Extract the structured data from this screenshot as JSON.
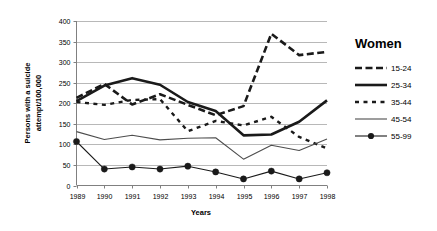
{
  "chart_data": {
    "type": "line",
    "title": "",
    "xlabel": "Years",
    "ylabel": "Persons with a suicide attempt/100,000",
    "ylabel_line1": "Persons with a suicide",
    "ylabel_line2": "attempt/100,000",
    "legend_title": "Women",
    "legend_position": "right",
    "grid": true,
    "x": [
      1989,
      1990,
      1991,
      1992,
      1993,
      1994,
      1995,
      1996,
      1997,
      1998
    ],
    "categories": [
      "1989",
      "1990",
      "1991",
      "1992",
      "1993",
      "1994",
      "1995",
      "1996",
      "1997",
      "1998"
    ],
    "xlim": [
      1989,
      1998
    ],
    "ylim": [
      0,
      400
    ],
    "yticks": [
      0,
      50,
      100,
      150,
      200,
      250,
      300,
      350,
      400
    ],
    "ytick_labels": [
      "0",
      "50",
      "100",
      "150",
      "200",
      "250",
      "300",
      "350",
      "400"
    ],
    "series": [
      {
        "name": "15-24",
        "style": "dashed-thick",
        "color": "#1a1a1a",
        "width": 2.6,
        "dash": "7,3.5",
        "marker": "none",
        "values": [
          213,
          247,
          197,
          222,
          196,
          171,
          193,
          369,
          317,
          325
        ]
      },
      {
        "name": "25-34",
        "style": "solid-thick",
        "color": "#1a1a1a",
        "width": 2.6,
        "dash": "none",
        "marker": "none",
        "values": [
          205,
          243,
          261,
          245,
          203,
          181,
          122,
          124,
          155,
          207
        ]
      },
      {
        "name": "35-44",
        "style": "dotted",
        "color": "#1a1a1a",
        "width": 2.4,
        "dash": "4,4.5",
        "marker": "none",
        "values": [
          203,
          196,
          208,
          210,
          132,
          157,
          146,
          167,
          118,
          90
        ]
      },
      {
        "name": "45-54",
        "style": "thin-solid",
        "color": "#4d4d4d",
        "width": 1.1,
        "dash": "none",
        "marker": "none",
        "values": [
          131,
          112,
          122,
          111,
          115,
          116,
          64,
          98,
          85,
          113
        ]
      },
      {
        "name": "55-99",
        "style": "solid-marker",
        "color": "#1a1a1a",
        "width": 1.1,
        "dash": "none",
        "marker": "circle",
        "values": [
          107,
          40,
          45,
          40,
          47,
          33,
          16,
          35,
          16,
          31
        ]
      }
    ]
  },
  "axis": {
    "x_title": "Years",
    "y_title_line1": "Persons with a suicide",
    "y_title_line2": "attempt/100,000"
  },
  "legend": {
    "title": "Women",
    "items": [
      {
        "label": "15-24"
      },
      {
        "label": "25-34"
      },
      {
        "label": "35-44"
      },
      {
        "label": "45-54"
      },
      {
        "label": "55-99"
      }
    ]
  },
  "colors": {
    "plot_line": "#1a1a1a",
    "thin_line": "#4d4d4d",
    "grid": "#a6a6a6",
    "axis": "#808080",
    "background": "#ffffff"
  }
}
